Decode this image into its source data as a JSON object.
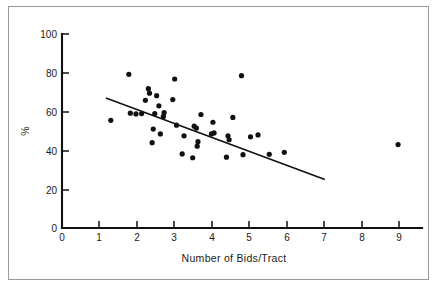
{
  "figure": {
    "background_color": "#ffffff",
    "frame_color": "#9a9a9a",
    "ink_color": "#111111"
  },
  "chart_data": {
    "type": "scatter",
    "title": "",
    "subtitle": "",
    "xlabel": "Number of Bids/Tract",
    "ylabel": "%",
    "xlim": [
      0,
      9.3
    ],
    "ylim": [
      0,
      100
    ],
    "xticks": [
      0,
      1,
      2,
      3,
      4,
      5,
      6,
      7,
      8,
      9
    ],
    "xtick_labels": [
      "0",
      "1",
      "2",
      "3",
      "4",
      "5",
      "6",
      "7",
      "8",
      "9"
    ],
    "yticks": [
      0,
      20,
      40,
      60,
      80,
      100
    ],
    "ytick_labels": [
      "0",
      "20",
      "40",
      "60",
      "80",
      "100"
    ],
    "grid": false,
    "legend": null,
    "marker": "filled-circle",
    "marker_size_px": 2.6,
    "points": [
      {
        "x": 1.3,
        "y": 55.5
      },
      {
        "x": 1.78,
        "y": 79.2
      },
      {
        "x": 1.82,
        "y": 59.2
      },
      {
        "x": 1.97,
        "y": 58.8
      },
      {
        "x": 2.12,
        "y": 59.0
      },
      {
        "x": 2.22,
        "y": 65.8
      },
      {
        "x": 2.3,
        "y": 71.8
      },
      {
        "x": 2.33,
        "y": 69.5
      },
      {
        "x": 2.4,
        "y": 44.0
      },
      {
        "x": 2.43,
        "y": 51.0
      },
      {
        "x": 2.47,
        "y": 59.0
      },
      {
        "x": 2.52,
        "y": 68.2
      },
      {
        "x": 2.58,
        "y": 63.0
      },
      {
        "x": 2.62,
        "y": 48.5
      },
      {
        "x": 2.7,
        "y": 57.5
      },
      {
        "x": 2.72,
        "y": 59.5
      },
      {
        "x": 2.95,
        "y": 66.2
      },
      {
        "x": 3.0,
        "y": 76.8
      },
      {
        "x": 3.05,
        "y": 53.0
      },
      {
        "x": 3.2,
        "y": 38.2
      },
      {
        "x": 3.25,
        "y": 47.5
      },
      {
        "x": 3.48,
        "y": 36.2
      },
      {
        "x": 3.52,
        "y": 52.5
      },
      {
        "x": 3.58,
        "y": 51.5
      },
      {
        "x": 3.6,
        "y": 42.2
      },
      {
        "x": 3.62,
        "y": 44.5
      },
      {
        "x": 3.7,
        "y": 58.5
      },
      {
        "x": 3.98,
        "y": 48.5
      },
      {
        "x": 4.02,
        "y": 54.5
      },
      {
        "x": 4.05,
        "y": 49.0
      },
      {
        "x": 4.38,
        "y": 36.5
      },
      {
        "x": 4.42,
        "y": 47.5
      },
      {
        "x": 4.45,
        "y": 45.5
      },
      {
        "x": 4.55,
        "y": 57.0
      },
      {
        "x": 4.78,
        "y": 78.5
      },
      {
        "x": 4.82,
        "y": 37.8
      },
      {
        "x": 5.02,
        "y": 47.0
      },
      {
        "x": 5.22,
        "y": 48.0
      },
      {
        "x": 5.52,
        "y": 38.0
      },
      {
        "x": 5.92,
        "y": 39.0
      },
      {
        "x": 8.95,
        "y": 43.0
      }
    ],
    "trend_line": {
      "type": "linear-fit",
      "x_start": 1.17,
      "y_start": 67.0,
      "x_end": 7.0,
      "y_end": 25.0
    }
  }
}
